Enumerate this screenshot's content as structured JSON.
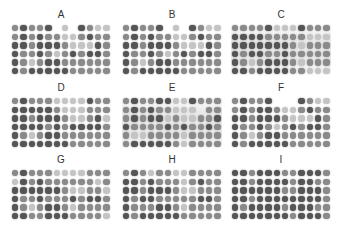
{
  "figure": {
    "columns": 12,
    "rows": 6,
    "dot_colors": {
      "0": "rgba(0,0,0,0)",
      "1": "#c4c4c4",
      "2": "#8a8a8a",
      "3": "#555555"
    },
    "panels": [
      {
        "label": "A",
        "x": 11,
        "y": 10,
        "haze": false,
        "intensity": [
          [
            2,
            3,
            2,
            2,
            3,
            0,
            1,
            0,
            3,
            2,
            1,
            1
          ],
          [
            2,
            3,
            2,
            3,
            2,
            2,
            1,
            1,
            2,
            3,
            2,
            2
          ],
          [
            3,
            3,
            2,
            3,
            3,
            3,
            2,
            1,
            1,
            1,
            3,
            2
          ],
          [
            3,
            2,
            2,
            3,
            2,
            1,
            2,
            3,
            2,
            3,
            3,
            2
          ],
          [
            3,
            2,
            1,
            2,
            3,
            3,
            2,
            2,
            2,
            2,
            2,
            2
          ],
          [
            3,
            2,
            3,
            3,
            3,
            3,
            3,
            2,
            2,
            2,
            2,
            2
          ]
        ]
      },
      {
        "label": "B",
        "x": 122,
        "y": 10,
        "haze": false,
        "intensity": [
          [
            2,
            3,
            2,
            2,
            3,
            0,
            1,
            0,
            3,
            2,
            1,
            1
          ],
          [
            2,
            3,
            2,
            3,
            2,
            2,
            1,
            1,
            2,
            3,
            2,
            2
          ],
          [
            3,
            3,
            2,
            3,
            3,
            3,
            2,
            1,
            1,
            1,
            3,
            2
          ],
          [
            3,
            2,
            2,
            3,
            2,
            1,
            2,
            3,
            2,
            3,
            3,
            2
          ],
          [
            3,
            2,
            1,
            2,
            3,
            3,
            2,
            2,
            2,
            2,
            2,
            2
          ],
          [
            3,
            2,
            3,
            3,
            3,
            3,
            3,
            2,
            2,
            2,
            2,
            2
          ]
        ]
      },
      {
        "label": "C",
        "x": 231,
        "y": 10,
        "haze": true,
        "intensity": [
          [
            2,
            2,
            2,
            2,
            3,
            1,
            1,
            1,
            3,
            2,
            2,
            2
          ],
          [
            3,
            3,
            3,
            3,
            2,
            2,
            2,
            2,
            2,
            1,
            1,
            1
          ],
          [
            3,
            3,
            3,
            3,
            3,
            3,
            3,
            2,
            1,
            2,
            2,
            2
          ],
          [
            3,
            2,
            3,
            3,
            2,
            2,
            3,
            2,
            2,
            2,
            2,
            2
          ],
          [
            3,
            2,
            1,
            2,
            3,
            3,
            3,
            2,
            1,
            2,
            2,
            2
          ],
          [
            3,
            3,
            2,
            3,
            3,
            3,
            3,
            2,
            2,
            1,
            1,
            1
          ]
        ]
      },
      {
        "label": "D",
        "x": 11,
        "y": 83,
        "haze": false,
        "intensity": [
          [
            2,
            3,
            2,
            2,
            2,
            1,
            1,
            1,
            1,
            3,
            2,
            2
          ],
          [
            3,
            3,
            3,
            3,
            3,
            2,
            1,
            1,
            1,
            2,
            2,
            2
          ],
          [
            3,
            3,
            2,
            3,
            3,
            3,
            2,
            1,
            1,
            2,
            3,
            1
          ],
          [
            3,
            3,
            3,
            3,
            2,
            3,
            2,
            3,
            3,
            3,
            3,
            2
          ],
          [
            3,
            2,
            1,
            2,
            3,
            3,
            2,
            2,
            2,
            2,
            2,
            2
          ],
          [
            3,
            3,
            3,
            3,
            3,
            3,
            3,
            2,
            2,
            2,
            2,
            2
          ]
        ]
      },
      {
        "label": "E",
        "x": 122,
        "y": 83,
        "haze": true,
        "intensity": [
          [
            2,
            3,
            2,
            2,
            3,
            3,
            1,
            1,
            3,
            2,
            2,
            2
          ],
          [
            2,
            3,
            2,
            3,
            2,
            2,
            1,
            1,
            1,
            0,
            2,
            2
          ],
          [
            2,
            3,
            2,
            3,
            3,
            1,
            2,
            1,
            1,
            2,
            2,
            3
          ],
          [
            3,
            2,
            2,
            2,
            2,
            3,
            2,
            3,
            2,
            2,
            3,
            2
          ],
          [
            2,
            1,
            1,
            2,
            2,
            2,
            2,
            1,
            2,
            2,
            2,
            2
          ],
          [
            2,
            3,
            3,
            3,
            3,
            3,
            2,
            1,
            2,
            2,
            2,
            2
          ]
        ]
      },
      {
        "label": "F",
        "x": 231,
        "y": 83,
        "haze": false,
        "intensity": [
          [
            2,
            3,
            2,
            2,
            3,
            0,
            0,
            0,
            3,
            2,
            1,
            1
          ],
          [
            2,
            3,
            2,
            3,
            3,
            2,
            1,
            1,
            2,
            3,
            2,
            2
          ],
          [
            3,
            3,
            2,
            3,
            3,
            3,
            2,
            1,
            1,
            1,
            3,
            2
          ],
          [
            3,
            2,
            2,
            3,
            2,
            1,
            2,
            3,
            2,
            3,
            3,
            2
          ],
          [
            3,
            2,
            1,
            2,
            3,
            3,
            2,
            2,
            2,
            2,
            2,
            2
          ],
          [
            3,
            2,
            3,
            3,
            3,
            3,
            3,
            2,
            2,
            2,
            2,
            2
          ]
        ]
      },
      {
        "label": "G",
        "x": 11,
        "y": 155,
        "haze": false,
        "intensity": [
          [
            2,
            3,
            2,
            2,
            2,
            1,
            1,
            1,
            1,
            2,
            2,
            2
          ],
          [
            1,
            3,
            2,
            3,
            2,
            2,
            2,
            2,
            2,
            2,
            1,
            2
          ],
          [
            3,
            3,
            3,
            3,
            3,
            3,
            2,
            1,
            1,
            2,
            2,
            1
          ],
          [
            3,
            2,
            2,
            3,
            2,
            2,
            2,
            3,
            2,
            3,
            3,
            2
          ],
          [
            3,
            2,
            1,
            2,
            3,
            3,
            2,
            1,
            2,
            2,
            2,
            2
          ],
          [
            3,
            3,
            2,
            2,
            3,
            3,
            3,
            2,
            2,
            2,
            2,
            1
          ]
        ]
      },
      {
        "label": "H",
        "x": 122,
        "y": 155,
        "haze": false,
        "intensity": [
          [
            2,
            3,
            2,
            1,
            2,
            2,
            1,
            1,
            2,
            2,
            2,
            2
          ],
          [
            3,
            3,
            2,
            3,
            2,
            2,
            2,
            1,
            2,
            3,
            2,
            2
          ],
          [
            3,
            3,
            2,
            3,
            3,
            3,
            2,
            1,
            1,
            2,
            2,
            2
          ],
          [
            3,
            2,
            3,
            3,
            2,
            2,
            2,
            2,
            2,
            3,
            3,
            2
          ],
          [
            3,
            2,
            2,
            2,
            3,
            3,
            2,
            1,
            2,
            2,
            2,
            2
          ],
          [
            3,
            2,
            3,
            3,
            3,
            3,
            3,
            2,
            2,
            2,
            2,
            2
          ]
        ]
      },
      {
        "label": "I",
        "x": 231,
        "y": 155,
        "haze": false,
        "intensity": [
          [
            3,
            3,
            2,
            3,
            3,
            3,
            2,
            2,
            3,
            3,
            3,
            2
          ],
          [
            3,
            3,
            2,
            3,
            3,
            3,
            3,
            2,
            3,
            3,
            2,
            2
          ],
          [
            3,
            3,
            3,
            3,
            3,
            3,
            2,
            2,
            3,
            3,
            3,
            2
          ],
          [
            3,
            3,
            2,
            3,
            3,
            3,
            3,
            3,
            3,
            3,
            3,
            2
          ],
          [
            3,
            2,
            3,
            3,
            3,
            3,
            2,
            3,
            3,
            3,
            2,
            2
          ],
          [
            3,
            3,
            3,
            3,
            3,
            3,
            3,
            2,
            3,
            3,
            3,
            2
          ]
        ]
      }
    ]
  }
}
